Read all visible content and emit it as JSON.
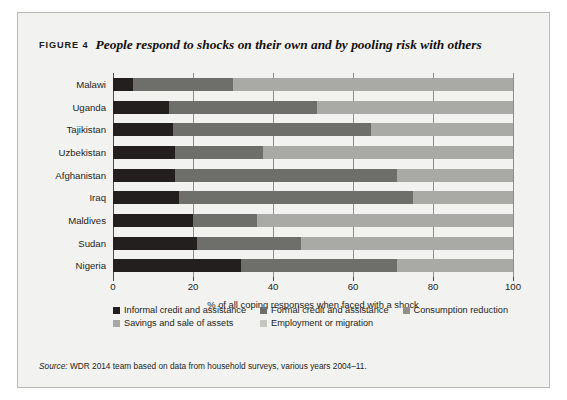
{
  "figure": {
    "label": "FIGURE 4",
    "title": "People respond to shocks on their own and by pooling risk with others",
    "source_label": "Source:",
    "source_text": " WDR 2014 team based on data from household surveys, various years 2004–11."
  },
  "chart_data": {
    "type": "bar",
    "orientation": "horizontal",
    "stacked": true,
    "title": "People respond to shocks on their own and by pooling risk with others",
    "xlabel": "% of all coping responses when faced with a shock",
    "ylabel": "",
    "xlim": [
      0,
      100
    ],
    "xticks": [
      0,
      20,
      40,
      60,
      80,
      100
    ],
    "xtick_labels": [
      "0",
      "20",
      "40",
      "60",
      "80",
      "100"
    ],
    "grid": true,
    "legend_position": "bottom",
    "categories": [
      "Malawi",
      "Uganda",
      "Tajikistan",
      "Uzbekistan",
      "Afghanistan",
      "Iraq",
      "Maldives",
      "Sudan",
      "Nigeria"
    ],
    "series": [
      {
        "name": "Informal credit and assistance",
        "color": "#231f1e",
        "values": [
          5,
          14,
          15,
          15.5,
          15.5,
          16.5,
          20,
          21,
          32
        ]
      },
      {
        "name": "Formal credit and assistance",
        "color": "#6e6e6b",
        "values": [
          25,
          37,
          49.5,
          22,
          55.5,
          58.5,
          16,
          26,
          39
        ]
      },
      {
        "name": "Consumption reduction",
        "color": "#8f8f8c",
        "values": [
          0,
          0,
          0,
          0,
          0,
          0,
          0,
          0,
          0
        ]
      },
      {
        "name": "Savings and sale of assets",
        "color": "#a9a9a6",
        "values": [
          70,
          49,
          35.5,
          62.5,
          29,
          25,
          64,
          53,
          29
        ]
      },
      {
        "name": "Employment or migration",
        "color": "#c6c6c3",
        "values": [
          0,
          0,
          0,
          0,
          0,
          0,
          0,
          0,
          0
        ]
      }
    ]
  }
}
